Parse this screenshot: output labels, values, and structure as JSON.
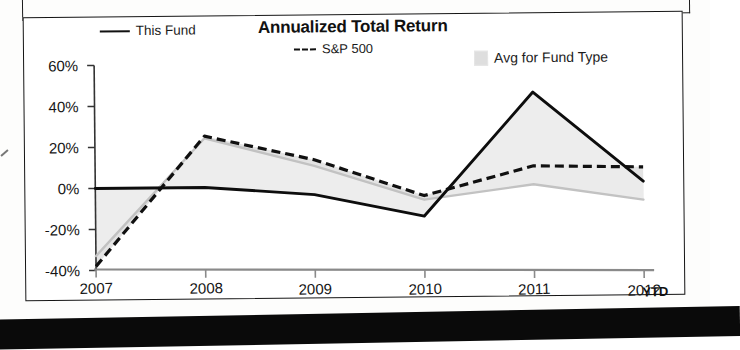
{
  "chart_data": {
    "type": "line",
    "title": "Annualized Total Return",
    "xlabel": "",
    "ylabel": "",
    "categories": [
      "2007",
      "2008",
      "2009",
      "2010",
      "2011",
      "2012"
    ],
    "x_axis_suffix": "YTD",
    "ylim": [
      -40,
      60
    ],
    "ytick_values": [
      60,
      40,
      20,
      0,
      -20,
      -40
    ],
    "ytick_labels": [
      "60%",
      "40%",
      "20%",
      "0%",
      "-20%",
      "-40%"
    ],
    "grid": false,
    "legend_position": "top",
    "series": [
      {
        "name": "This Fund",
        "style": "solid",
        "color": "#111111",
        "values": [
          0,
          0,
          -4,
          -15,
          45,
          1
        ]
      },
      {
        "name": "S&P 500",
        "style": "dashed",
        "color": "#111111",
        "values": [
          -38,
          25,
          13,
          -5,
          9,
          8
        ]
      },
      {
        "name": "Avg for Fund Type",
        "style": "shaded-band",
        "color": "#d8d8d8",
        "values": [
          -33,
          24,
          10,
          -7,
          0,
          -8
        ]
      }
    ]
  },
  "legend": {
    "items": [
      {
        "label": "This Fund",
        "swatch": "solid-line-swatch"
      },
      {
        "label": "S&P 500",
        "swatch": "dashed-line-swatch"
      },
      {
        "label": "Avg for Fund Type",
        "swatch": "gray-box-swatch"
      }
    ]
  }
}
